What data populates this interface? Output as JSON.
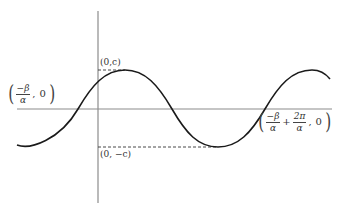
{
  "diagram": {
    "type": "sinusoid-graph",
    "colors": {
      "axis": "#8c8c8c",
      "curve": "#1a1a1a",
      "dashed": "#333333",
      "text": "#333333"
    },
    "axes": {
      "x_axis": {
        "x1": 17,
        "y": 109,
        "x2": 332
      },
      "y_axis": {
        "x": 98,
        "y1": 11,
        "y2": 203
      }
    },
    "curve": {
      "left_end": [
        17,
        145
      ],
      "zero_crossings_x": [
        78,
        172,
        265
      ],
      "max_points": [
        [
          125,
          70
        ],
        [
          312,
          70
        ]
      ],
      "min_points": [
        [
          218,
          147
        ]
      ],
      "right_end": [
        330,
        79
      ]
    },
    "labels": {
      "max_label": "(0,c)",
      "min_label": "(0, −c)",
      "left_intercept": {
        "numerator": "−β",
        "denominator": "α",
        "tail": "0"
      },
      "right_intercept": {
        "term1_numerator": "−β",
        "term1_denominator": "α",
        "plus": "+",
        "term2_numerator": "2π",
        "term2_denominator": "α",
        "tail": "0"
      },
      "comma": ","
    }
  }
}
